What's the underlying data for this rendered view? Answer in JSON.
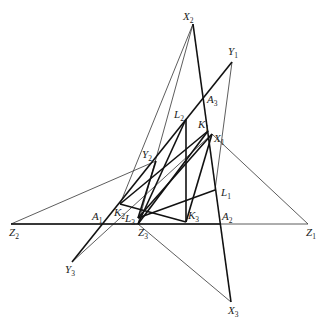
{
  "diagram": {
    "type": "geometry-construction",
    "points": {
      "X2": {
        "x": 193,
        "y": 24
      },
      "Y1": {
        "x": 232,
        "y": 62
      },
      "A3": {
        "x": 205,
        "y": 96
      },
      "L2": {
        "x": 186,
        "y": 119
      },
      "K1": {
        "x": 208,
        "y": 131
      },
      "X1": {
        "x": 212,
        "y": 134
      },
      "Y2": {
        "x": 156,
        "y": 161
      },
      "L1": {
        "x": 215,
        "y": 190
      },
      "K2": {
        "x": 120,
        "y": 204
      },
      "L3": {
        "x": 138,
        "y": 218
      },
      "Z3": {
        "x": 138,
        "y": 224
      },
      "K3": {
        "x": 186,
        "y": 222
      },
      "A1": {
        "x": 101,
        "y": 224
      },
      "A2": {
        "x": 221,
        "y": 224
      },
      "Z2": {
        "x": 11,
        "y": 224
      },
      "Z1": {
        "x": 308,
        "y": 224
      },
      "Y3": {
        "x": 72,
        "y": 262
      },
      "X3": {
        "x": 231,
        "y": 302
      }
    },
    "labels": [
      {
        "id": "X2",
        "main": "X",
        "sub": "2",
        "x": 183,
        "y": 20
      },
      {
        "id": "Y1",
        "main": "Y",
        "sub": "1",
        "x": 228,
        "y": 55
      },
      {
        "id": "A3",
        "main": "A",
        "sub": "3",
        "x": 207,
        "y": 103
      },
      {
        "id": "L2",
        "main": "L",
        "sub": "2",
        "x": 174,
        "y": 118
      },
      {
        "id": "K1",
        "main": "K",
        "sub": "1",
        "x": 198,
        "y": 128
      },
      {
        "id": "X1",
        "main": "X",
        "sub": "1",
        "x": 214,
        "y": 142
      },
      {
        "id": "Y2",
        "main": "Y",
        "sub": "2",
        "x": 142,
        "y": 158
      },
      {
        "id": "L1",
        "main": "L",
        "sub": "1",
        "x": 221,
        "y": 196
      },
      {
        "id": "K2",
        "main": "K",
        "sub": "2",
        "x": 114,
        "y": 216
      },
      {
        "id": "L3",
        "main": "L",
        "sub": "3",
        "x": 125,
        "y": 222
      },
      {
        "id": "K3",
        "main": "K",
        "sub": "3",
        "x": 188,
        "y": 219
      },
      {
        "id": "A1",
        "main": "A",
        "sub": "1",
        "x": 92,
        "y": 220
      },
      {
        "id": "A2",
        "main": "A",
        "sub": "2",
        "x": 222,
        "y": 220
      },
      {
        "id": "Z2",
        "main": "Z",
        "sub": "2",
        "x": 9,
        "y": 236
      },
      {
        "id": "Z3",
        "main": "Z",
        "sub": "3",
        "x": 138,
        "y": 236
      },
      {
        "id": "Z1",
        "main": "Z",
        "sub": "1",
        "x": 306,
        "y": 236
      },
      {
        "id": "Y3",
        "main": "Y",
        "sub": "3",
        "x": 65,
        "y": 273
      },
      {
        "id": "X3",
        "main": "X",
        "sub": "3",
        "x": 228,
        "y": 314
      }
    ],
    "thin_lines": [
      [
        "Z2",
        "Z1"
      ],
      [
        "X2",
        "Z3"
      ],
      [
        "Y1",
        "L1"
      ],
      [
        "X1",
        "Z1"
      ],
      [
        "Y2",
        "Z2"
      ],
      [
        "Y3",
        "X1"
      ],
      [
        "Z3",
        "X3"
      ],
      [
        "X2",
        "K2"
      ]
    ],
    "thick_lines": [
      [
        "Z2",
        "A2"
      ],
      [
        "X2",
        "X3"
      ],
      [
        "Y1",
        "Y3"
      ],
      [
        "L2",
        "K3"
      ],
      [
        "L2",
        "Z3"
      ],
      [
        "K1",
        "K2"
      ],
      [
        "K1",
        "Z3"
      ],
      [
        "X1",
        "L3"
      ],
      [
        "X1",
        "K3"
      ],
      [
        "L1",
        "L3"
      ],
      [
        "K2",
        "K3"
      ],
      [
        "Y2",
        "L3"
      ]
    ]
  }
}
